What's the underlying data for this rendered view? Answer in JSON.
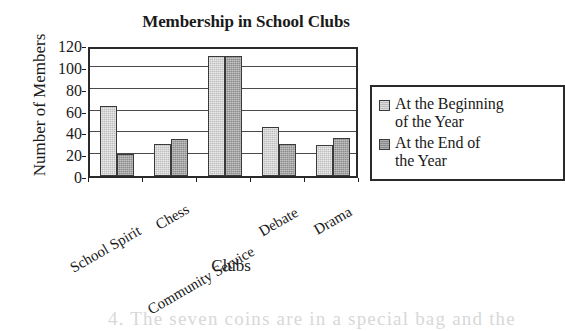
{
  "chart_data": {
    "type": "bar",
    "title": "Membership in School Clubs",
    "xlabel": "Clubs",
    "ylabel": "Number of Members",
    "categories": [
      "School Spirit",
      "Chess",
      "Community Service",
      "Debate",
      "Drama"
    ],
    "series": [
      {
        "name": "At the Beginning\nof the Year",
        "values": [
          64,
          29,
          110,
          45,
          28
        ],
        "color": "#bdbdbd"
      },
      {
        "name": "At the End of\nthe Year",
        "values": [
          20,
          34,
          110,
          29,
          35
        ],
        "color": "#8c8c8c"
      }
    ],
    "ylim": [
      0,
      120
    ],
    "yticks": [
      0,
      20,
      40,
      60,
      80,
      100,
      120
    ],
    "ytick_labels": [
      "0",
      "20",
      "40",
      "60",
      "80",
      "100",
      "120"
    ],
    "grid": true,
    "grid_axis": "y",
    "legend_position": "right",
    "legend_entries": [
      "At the Beginning\nof the Year",
      "At the End of\nthe Year"
    ]
  },
  "legend": {
    "entries": [
      {
        "label": "At the Beginning\nof the Year"
      },
      {
        "label": "At the End of\nthe Year"
      }
    ]
  },
  "artifact": {
    "bottom_text": "4.  The seven coins are in a special bag and the"
  }
}
